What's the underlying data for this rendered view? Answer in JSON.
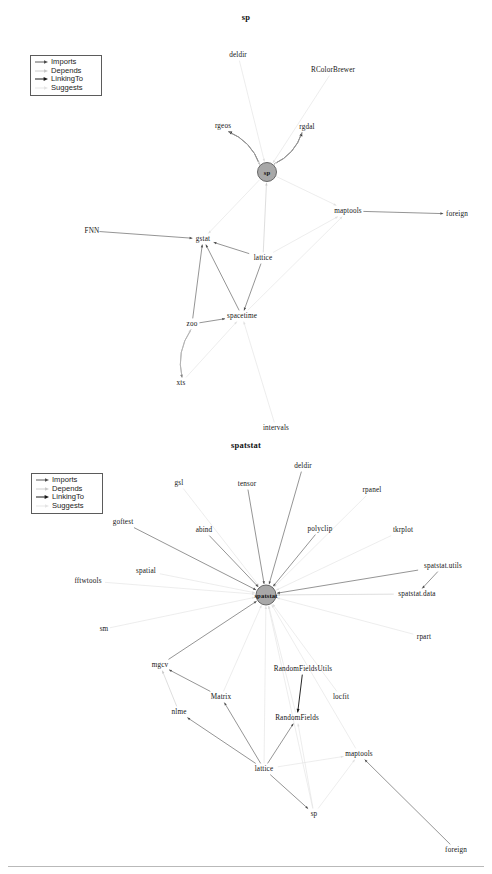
{
  "page": {
    "background": "#ffffff",
    "width": 492,
    "height": 874
  },
  "legend": {
    "items": [
      {
        "label": "Imports",
        "color": "#4d4d4d",
        "style": "solid",
        "arrow": true
      },
      {
        "label": "Depends",
        "color": "#c8c8c8",
        "style": "solid",
        "arrow": false
      },
      {
        "label": "LinkingTo",
        "color": "#1a1a1a",
        "style": "solid",
        "arrow": true
      },
      {
        "label": "Suggests",
        "color": "#e0e0e0",
        "style": "solid",
        "arrow": false
      }
    ]
  },
  "graphs": [
    {
      "id": "sp",
      "title": "sp",
      "center": {
        "label": "sp",
        "x": 267,
        "y": 172,
        "r": 9.5,
        "fill": "#a8a8a8",
        "stroke": "#5a5a5a"
      },
      "nodes": [
        {
          "label": "deldir",
          "x": 238,
          "y": 55
        },
        {
          "label": "RColorBrewer",
          "x": 333,
          "y": 70
        },
        {
          "label": "rgeos",
          "x": 223,
          "y": 126
        },
        {
          "label": "rgdal",
          "x": 307,
          "y": 127
        },
        {
          "label": "maptools",
          "x": 348,
          "y": 211
        },
        {
          "label": "foreign",
          "x": 457,
          "y": 214
        },
        {
          "label": "FNN",
          "x": 92,
          "y": 231
        },
        {
          "label": "gstat",
          "x": 203,
          "y": 239
        },
        {
          "label": "lattice",
          "x": 263,
          "y": 258
        },
        {
          "label": "spacetime",
          "x": 242,
          "y": 316
        },
        {
          "label": "zoo",
          "x": 192,
          "y": 324
        },
        {
          "label": "xts",
          "x": 181,
          "y": 383
        },
        {
          "label": "intervals",
          "x": 276,
          "y": 428
        }
      ],
      "edges": [
        {
          "from": "deldir",
          "to": "sp",
          "type": "Suggests"
        },
        {
          "from": "RColorBrewer",
          "to": "sp",
          "type": "Suggests"
        },
        {
          "from": "sp",
          "to": "rgeos",
          "type": "LinkingTo"
        },
        {
          "from": "rgeos",
          "to": "sp",
          "type": "Suggests"
        },
        {
          "from": "sp",
          "to": "rgdal",
          "type": "LinkingTo"
        },
        {
          "from": "rgdal",
          "to": "sp",
          "type": "Suggests"
        },
        {
          "from": "sp",
          "to": "maptools",
          "type": "Suggests"
        },
        {
          "from": "maptools",
          "to": "foreign",
          "type": "Imports"
        },
        {
          "from": "FNN",
          "to": "gstat",
          "type": "Imports"
        },
        {
          "from": "sp",
          "to": "gstat",
          "type": "Suggests"
        },
        {
          "from": "lattice",
          "to": "sp",
          "type": "Depends"
        },
        {
          "from": "lattice",
          "to": "gstat",
          "type": "Imports"
        },
        {
          "from": "lattice",
          "to": "maptools",
          "type": "Suggests"
        },
        {
          "from": "lattice",
          "to": "spacetime",
          "type": "Imports"
        },
        {
          "from": "spacetime",
          "to": "gstat",
          "type": "Imports"
        },
        {
          "from": "zoo",
          "to": "gstat",
          "type": "Imports"
        },
        {
          "from": "zoo",
          "to": "spacetime",
          "type": "Imports"
        },
        {
          "from": "zoo",
          "to": "xts",
          "type": "Imports"
        },
        {
          "from": "xts",
          "to": "zoo",
          "type": "Depends"
        },
        {
          "from": "xts",
          "to": "spacetime",
          "type": "Suggests"
        },
        {
          "from": "intervals",
          "to": "spacetime",
          "type": "Suggests"
        },
        {
          "from": "spacetime",
          "to": "maptools",
          "type": "Suggests"
        }
      ]
    },
    {
      "id": "spatstat",
      "title": "spatstat",
      "center": {
        "label": "spatstat",
        "x": 266,
        "y": 595,
        "r": 10,
        "fill": "#a8a8a8",
        "stroke": "#5a5a5a"
      },
      "nodes": [
        {
          "label": "gsl",
          "x": 179,
          "y": 483
        },
        {
          "label": "tensor",
          "x": 247,
          "y": 484
        },
        {
          "label": "deldir",
          "x": 303,
          "y": 466
        },
        {
          "label": "rpanel",
          "x": 372,
          "y": 490
        },
        {
          "label": "goftest",
          "x": 123,
          "y": 522
        },
        {
          "label": "abind",
          "x": 204,
          "y": 530
        },
        {
          "label": "polyclip",
          "x": 320,
          "y": 529
        },
        {
          "label": "tkrplot",
          "x": 403,
          "y": 530
        },
        {
          "label": "spatial",
          "x": 146,
          "y": 571
        },
        {
          "label": "fftwtools",
          "x": 88,
          "y": 581
        },
        {
          "label": "spatstat.utils",
          "x": 443,
          "y": 566
        },
        {
          "label": "spatstat.data",
          "x": 417,
          "y": 594
        },
        {
          "label": "sm",
          "x": 104,
          "y": 629
        },
        {
          "label": "rpart",
          "x": 424,
          "y": 637
        },
        {
          "label": "mgcv",
          "x": 160,
          "y": 665
        },
        {
          "label": "RandomFieldsUtils",
          "x": 303,
          "y": 669
        },
        {
          "label": "Matrix",
          "x": 221,
          "y": 697
        },
        {
          "label": "locfit",
          "x": 341,
          "y": 697
        },
        {
          "label": "nlme",
          "x": 179,
          "y": 712
        },
        {
          "label": "RandomFields",
          "x": 297,
          "y": 718
        },
        {
          "label": "maptools",
          "x": 359,
          "y": 754
        },
        {
          "label": "lattice",
          "x": 264,
          "y": 769
        },
        {
          "label": "sp",
          "x": 314,
          "y": 814
        },
        {
          "label": "foreign",
          "x": 456,
          "y": 850
        }
      ],
      "edges": [
        {
          "from": "gsl",
          "to": "spatstat",
          "type": "Suggests"
        },
        {
          "from": "tensor",
          "to": "spatstat",
          "type": "Imports"
        },
        {
          "from": "deldir",
          "to": "spatstat",
          "type": "Imports"
        },
        {
          "from": "rpanel",
          "to": "spatstat",
          "type": "Suggests"
        },
        {
          "from": "goftest",
          "to": "spatstat",
          "type": "Imports"
        },
        {
          "from": "abind",
          "to": "spatstat",
          "type": "Imports"
        },
        {
          "from": "polyclip",
          "to": "spatstat",
          "type": "Imports"
        },
        {
          "from": "tkrplot",
          "to": "spatstat",
          "type": "Suggests"
        },
        {
          "from": "spatial",
          "to": "spatstat",
          "type": "Suggests"
        },
        {
          "from": "fftwtools",
          "to": "spatstat",
          "type": "Suggests"
        },
        {
          "from": "spatstat.utils",
          "to": "spatstat",
          "type": "Imports"
        },
        {
          "from": "spatstat.data",
          "to": "spatstat",
          "type": "Depends"
        },
        {
          "from": "spatstat.utils",
          "to": "spatstat.data",
          "type": "Imports"
        },
        {
          "from": "sm",
          "to": "spatstat",
          "type": "Suggests"
        },
        {
          "from": "rpart",
          "to": "spatstat",
          "type": "Suggests"
        },
        {
          "from": "mgcv",
          "to": "spatstat",
          "type": "Imports"
        },
        {
          "from": "RandomFieldsUtils",
          "to": "RandomFields",
          "type": "LinkingTo"
        },
        {
          "from": "RandomFields",
          "to": "spatstat",
          "type": "Suggests"
        },
        {
          "from": "Matrix",
          "to": "spatstat",
          "type": "Suggests"
        },
        {
          "from": "locfit",
          "to": "spatstat",
          "type": "Suggests"
        },
        {
          "from": "nlme",
          "to": "mgcv",
          "type": "Depends"
        },
        {
          "from": "Matrix",
          "to": "mgcv",
          "type": "Imports"
        },
        {
          "from": "lattice",
          "to": "Matrix",
          "type": "Imports"
        },
        {
          "from": "lattice",
          "to": "nlme",
          "type": "Imports"
        },
        {
          "from": "lattice",
          "to": "RandomFields",
          "type": "Imports"
        },
        {
          "from": "lattice",
          "to": "sp",
          "type": "Imports"
        },
        {
          "from": "lattice",
          "to": "maptools",
          "type": "Suggests"
        },
        {
          "from": "sp",
          "to": "maptools",
          "type": "Suggests"
        },
        {
          "from": "sp",
          "to": "RandomFields",
          "type": "Suggests"
        },
        {
          "from": "foreign",
          "to": "maptools",
          "type": "Imports"
        },
        {
          "from": "maptools",
          "to": "spatstat",
          "type": "Suggests"
        },
        {
          "from": "sp",
          "to": "spatstat",
          "type": "Suggests"
        },
        {
          "from": "lattice",
          "to": "spatstat",
          "type": "Suggests"
        }
      ]
    }
  ]
}
